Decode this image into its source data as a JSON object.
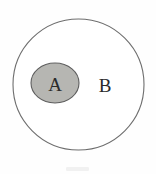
{
  "figure": {
    "type": "euler-diagram",
    "background_color": "#fefefe"
  },
  "outer_set": {
    "label": "B",
    "shape": "circle",
    "fill_color": "#ffffff",
    "stroke_color": "#6e6e6e",
    "stroke_width": 1.1,
    "center_x": 78.5,
    "center_y": 84.5,
    "radius": 65.5,
    "label_x": 105,
    "label_y": 92
  },
  "inner_set": {
    "label": "A",
    "shape": "ellipse",
    "fill_color": "#b6b6b2",
    "stroke_color": "#5e5e5e",
    "stroke_width": 1.1,
    "center_x": 55,
    "center_y": 83,
    "radius_x": 24,
    "radius_y": 20,
    "label_x": 55,
    "label_y": 91
  },
  "relation": {
    "notation": "A ⊂ B",
    "reading": "A is a subset of B"
  }
}
